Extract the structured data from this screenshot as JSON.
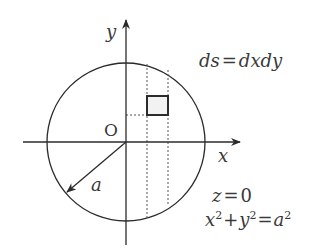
{
  "diagram": {
    "colors": {
      "stroke": "#2b2b2b",
      "text": "#3a3a3a",
      "dashed": "#555555",
      "element_fill": "#f2f2f2",
      "background": "#ffffff"
    },
    "axes": {
      "x_label": "x",
      "y_label": "y",
      "origin_label": "O"
    },
    "circle": {
      "center": [
        126,
        142
      ],
      "radius": 79,
      "radius_label": "a"
    },
    "area_element": {
      "x_range": [
        147,
        168
      ],
      "y_range": [
        96,
        115
      ]
    },
    "equations": {
      "area_element": {
        "lhs": "ds",
        "eq": "=",
        "rhs": "dxdy"
      },
      "plane": {
        "lhs": "z",
        "eq": "=",
        "rhs": "0"
      },
      "circle_eq": {
        "x": "x",
        "x_exp": "2",
        "plus": "+",
        "y": "y",
        "y_exp": "2",
        "eq": "=",
        "a": "a",
        "a_exp": "2"
      }
    }
  }
}
